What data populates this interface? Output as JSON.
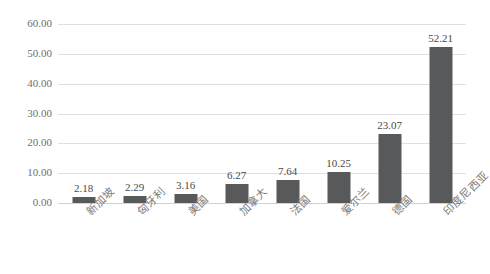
{
  "chart_data": {
    "type": "bar",
    "title": "",
    "subtitle": "",
    "xlabel": "",
    "ylabel": "",
    "categories": [
      "新加坡",
      "匈牙利",
      "美国",
      "加拿大",
      "法国",
      "爱尔兰",
      "德国",
      "印度尼西亚"
    ],
    "values": [
      2.18,
      2.29,
      3.16,
      6.27,
      7.64,
      10.25,
      23.07,
      52.21
    ],
    "value_labels": [
      "2.18",
      "2.29",
      "3.16",
      "6.27",
      "7.64",
      "10.25",
      "23.07",
      "52.21"
    ],
    "ylim": [
      0,
      60
    ],
    "ytick_values": [
      60,
      50,
      40,
      30,
      20,
      10,
      0
    ],
    "ytick_labels": [
      "60.00",
      "50.00",
      "40.00",
      "30.00",
      "20.00",
      "10.00",
      "0.00"
    ],
    "grid": true,
    "grid_axis": "y",
    "legend": false,
    "legend_position": "none",
    "series": [
      {
        "name": "",
        "values": [
          2.18,
          2.29,
          3.16,
          6.27,
          7.64,
          10.25,
          23.07,
          52.21
        ]
      }
    ],
    "colors": {
      "bar": "#58595b",
      "gridline": "#e0e0e0",
      "baseline": "#d2d2d2",
      "ytick_text": "#6f6f6f",
      "xtick_text": "#7b7b7b",
      "value_text": "#4a4a4a",
      "background": "#ffffff"
    }
  },
  "artifact": {
    "top_strip_text": "· ·· ··· ···· ··· ··"
  }
}
